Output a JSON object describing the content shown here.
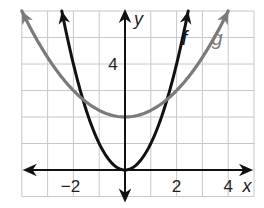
{
  "chart_data": {
    "type": "line",
    "title": "",
    "xlabel": "x",
    "ylabel": "y",
    "xlim": [
      -4,
      5
    ],
    "ylim": [
      -1,
      6
    ],
    "grid": true,
    "grid_step": 1,
    "x_ticks": [
      {
        "value": -2,
        "label": "−2"
      },
      {
        "value": 2,
        "label": "2"
      },
      {
        "value": 4,
        "label": "4"
      }
    ],
    "y_ticks": [
      {
        "value": 4,
        "label": "4"
      }
    ],
    "series": [
      {
        "name": "f",
        "label": "f",
        "color": "#111111",
        "formula": "x^2",
        "x": [
          -2.45,
          -2,
          -1,
          0,
          1,
          2,
          2.45
        ],
        "y": [
          6,
          4,
          1,
          0,
          1,
          4,
          6
        ]
      },
      {
        "name": "g",
        "label": "g",
        "color": "#7a7a7a",
        "formula": "0.25x^2 + 2",
        "x": [
          -4,
          -2,
          0,
          2,
          4
        ],
        "y": [
          6,
          3,
          2,
          3,
          6
        ]
      }
    ],
    "legend": "inline labels near curve ends"
  },
  "colors": {
    "grid": "#c8c8c8",
    "axis": "#111111",
    "f": "#111111",
    "g": "#7a7a7a"
  }
}
